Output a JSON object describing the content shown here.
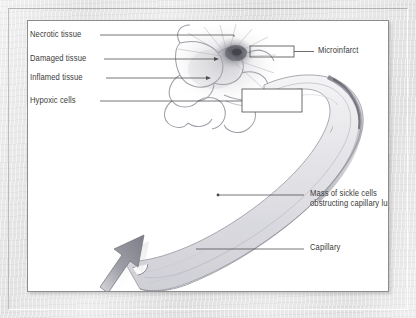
{
  "figure": {
    "panel_background": "#ffffff",
    "frame_color": "#e8e8e8",
    "ink_color": "#3a3a3a",
    "line_color": "#5a5a5a"
  },
  "labels": {
    "necrotic_tissue": "Necrotic tissue",
    "damaged_tissue": "Damaged tissue",
    "inflamed_tissue": "Inflamed tissue",
    "hypoxic_cells": "Hypoxic cells",
    "microinfarct": "Microinfarct",
    "mass_line1": "Mass of sickle cells",
    "mass_line2": "obstructing capillary lumen",
    "capillary": "Capillary"
  },
  "structures": {
    "microinfarct_core": "dark radiating necrotic focus",
    "capillary_network": "branching vessel network",
    "capillary_tube": "U-shaped capillary vessel",
    "sickle_cell_mass": "crescent sickle cells packed in lumen",
    "flow_arrow": "blood flow direction arrow"
  }
}
